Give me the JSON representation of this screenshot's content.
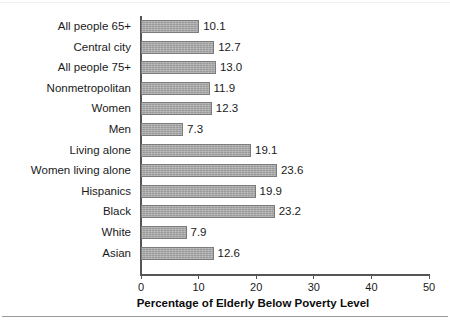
{
  "chart_data": {
    "type": "bar",
    "orientation": "horizontal",
    "title": "",
    "xlabel": "Percentage of Elderly Below Poverty Level",
    "ylabel": "",
    "xlim": [
      0,
      50
    ],
    "xticks": [
      0,
      10,
      20,
      30,
      40,
      50
    ],
    "xtick_labels": [
      "0",
      "10",
      "20",
      "30",
      "40",
      "50"
    ],
    "grid": false,
    "legend": false,
    "bar_color": "#a9a9a9",
    "bar_edge_color": "#7c7c7c",
    "axis_color": "#555555",
    "categories": [
      "All people 65+",
      "Central city",
      "All people 75+",
      "Nonmetropolitan",
      "Women",
      "Men",
      "Living alone",
      "Women living alone",
      "Hispanics",
      "Black",
      "White",
      "Asian"
    ],
    "values": [
      10.1,
      12.7,
      13.0,
      11.9,
      12.3,
      7.3,
      19.1,
      23.6,
      19.9,
      23.2,
      7.9,
      12.6
    ],
    "value_labels": [
      "10.1",
      "12.7",
      "13.0",
      "11.9",
      "12.3",
      "7.3",
      "19.1",
      "23.6",
      "19.9",
      "23.2",
      "7.9",
      "12.6"
    ]
  }
}
